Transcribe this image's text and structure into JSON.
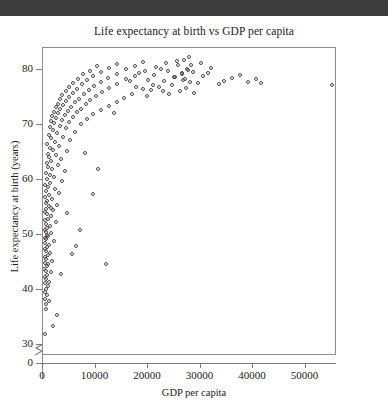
{
  "window": {
    "top_band_color": "#3c3c3c"
  },
  "chart_data": {
    "type": "scatter",
    "title": "Life expectancy at birth vs GDP per capita",
    "xlabel": "GDP per capita",
    "ylabel": "Life expectancy at birth (years)",
    "xlim": [
      0,
      56000
    ],
    "ylim": [
      28,
      84
    ],
    "y_axis_break": true,
    "y_axis_break_note": "axis broken between 0 and ~28",
    "grid": false,
    "legend": null,
    "marker": "open-circle",
    "marker_color": "#4a4a4a",
    "xticks": [
      0,
      10000,
      20000,
      30000,
      40000,
      50000
    ],
    "xtick_labels": [
      "0",
      "10000",
      "20000",
      "30000",
      "40000",
      "50000"
    ],
    "yticks": [
      30,
      40,
      50,
      60,
      70,
      80
    ],
    "ytick_labels": [
      "30",
      "40",
      "50",
      "60",
      "70",
      "80"
    ],
    "y_zero_tick_label": "0",
    "points": [
      [
        420,
        32.0
      ],
      [
        510,
        36.6
      ],
      [
        650,
        37.5
      ],
      [
        300,
        38.3
      ],
      [
        760,
        39.1
      ],
      [
        380,
        39.6
      ],
      [
        560,
        40.2
      ],
      [
        900,
        40.8
      ],
      [
        470,
        41.2
      ],
      [
        1200,
        41.5
      ],
      [
        640,
        42.0
      ],
      [
        350,
        42.4
      ],
      [
        820,
        42.8
      ],
      [
        1500,
        43.2
      ],
      [
        540,
        43.5
      ],
      [
        260,
        43.9
      ],
      [
        700,
        44.3
      ],
      [
        980,
        44.7
      ],
      [
        430,
        45.0
      ],
      [
        1800,
        45.3
      ],
      [
        610,
        45.6
      ],
      [
        330,
        46.0
      ],
      [
        870,
        46.4
      ],
      [
        1350,
        46.8
      ],
      [
        520,
        47.1
      ],
      [
        290,
        47.4
      ],
      [
        740,
        47.8
      ],
      [
        1100,
        48.2
      ],
      [
        450,
        48.5
      ],
      [
        2100,
        48.9
      ],
      [
        580,
        49.2
      ],
      [
        360,
        49.5
      ],
      [
        920,
        49.9
      ],
      [
        1600,
        50.3
      ],
      [
        500,
        50.6
      ],
      [
        310,
        51.0
      ],
      [
        780,
        51.3
      ],
      [
        1250,
        51.7
      ],
      [
        620,
        52.0
      ],
      [
        2400,
        52.3
      ],
      [
        410,
        52.7
      ],
      [
        950,
        53.0
      ],
      [
        1450,
        53.4
      ],
      [
        700,
        53.8
      ],
      [
        340,
        54.1
      ],
      [
        1900,
        54.5
      ],
      [
        560,
        54.8
      ],
      [
        1050,
        55.2
      ],
      [
        2700,
        55.5
      ],
      [
        480,
        55.9
      ],
      [
        800,
        56.2
      ],
      [
        1700,
        56.6
      ],
      [
        390,
        57.0
      ],
      [
        1150,
        57.3
      ],
      [
        3100,
        57.7
      ],
      [
        650,
        58.0
      ],
      [
        2200,
        58.4
      ],
      [
        900,
        58.8
      ],
      [
        460,
        59.1
      ],
      [
        1400,
        59.5
      ],
      [
        3600,
        59.8
      ],
      [
        750,
        60.2
      ],
      [
        2000,
        60.6
      ],
      [
        1250,
        61.0
      ],
      [
        530,
        61.3
      ],
      [
        4100,
        61.6
      ],
      [
        1750,
        62.0
      ],
      [
        980,
        62.4
      ],
      [
        2900,
        62.7
      ],
      [
        680,
        63.1
      ],
      [
        1550,
        63.4
      ],
      [
        3400,
        63.8
      ],
      [
        1150,
        64.1
      ],
      [
        2450,
        64.5
      ],
      [
        860,
        64.8
      ],
      [
        4600,
        65.2
      ],
      [
        1950,
        65.5
      ],
      [
        1350,
        65.9
      ],
      [
        3050,
        66.2
      ],
      [
        760,
        66.6
      ],
      [
        2250,
        66.9
      ],
      [
        5200,
        67.2
      ],
      [
        1550,
        67.6
      ],
      [
        3800,
        67.9
      ],
      [
        1050,
        68.2
      ],
      [
        2700,
        68.5
      ],
      [
        6100,
        68.8
      ],
      [
        1850,
        69.1
      ],
      [
        4300,
        69.4
      ],
      [
        1250,
        69.6
      ],
      [
        3200,
        69.9
      ],
      [
        7200,
        70.1
      ],
      [
        2100,
        70.3
      ],
      [
        5000,
        70.5
      ],
      [
        1500,
        70.7
      ],
      [
        3700,
        70.9
      ],
      [
        8400,
        71.1
      ],
      [
        2400,
        71.3
      ],
      [
        5700,
        71.5
      ],
      [
        1750,
        71.6
      ],
      [
        4200,
        71.8
      ],
      [
        9600,
        72.0
      ],
      [
        2800,
        72.1
      ],
      [
        6400,
        72.3
      ],
      [
        2050,
        72.4
      ],
      [
        4800,
        72.6
      ],
      [
        11000,
        72.7
      ],
      [
        3300,
        72.9
      ],
      [
        7200,
        73.0
      ],
      [
        2400,
        73.2
      ],
      [
        5400,
        73.3
      ],
      [
        12500,
        73.5
      ],
      [
        3800,
        73.6
      ],
      [
        8100,
        73.8
      ],
      [
        2800,
        73.9
      ],
      [
        6100,
        74.1
      ],
      [
        14000,
        74.2
      ],
      [
        4400,
        74.4
      ],
      [
        9000,
        74.5
      ],
      [
        3200,
        74.7
      ],
      [
        6900,
        74.8
      ],
      [
        15500,
        75.0
      ],
      [
        5000,
        75.1
      ],
      [
        10000,
        75.3
      ],
      [
        3700,
        75.4
      ],
      [
        7800,
        75.6
      ],
      [
        17000,
        75.7
      ],
      [
        5700,
        75.9
      ],
      [
        11200,
        76.0
      ],
      [
        4300,
        76.2
      ],
      [
        8700,
        76.3
      ],
      [
        19000,
        76.5
      ],
      [
        6500,
        76.6
      ],
      [
        12500,
        76.8
      ],
      [
        5000,
        76.9
      ],
      [
        9800,
        77.1
      ],
      [
        21000,
        77.2
      ],
      [
        7400,
        77.4
      ],
      [
        14000,
        77.5
      ],
      [
        5800,
        77.7
      ],
      [
        11000,
        77.8
      ],
      [
        23000,
        78.0
      ],
      [
        8400,
        78.1
      ],
      [
        15800,
        78.3
      ],
      [
        6700,
        78.4
      ],
      [
        12400,
        78.6
      ],
      [
        25000,
        78.7
      ],
      [
        9600,
        78.9
      ],
      [
        17500,
        79.0
      ],
      [
        7700,
        79.2
      ],
      [
        14000,
        79.3
      ],
      [
        26500,
        79.5
      ],
      [
        11000,
        79.6
      ],
      [
        19500,
        79.8
      ],
      [
        8900,
        79.9
      ],
      [
        15800,
        80.1
      ],
      [
        27500,
        80.2
      ],
      [
        12500,
        80.4
      ],
      [
        21500,
        80.5
      ],
      [
        10200,
        80.7
      ],
      [
        17500,
        80.8
      ],
      [
        28200,
        81.0
      ],
      [
        14000,
        81.1
      ],
      [
        23500,
        81.3
      ],
      [
        19000,
        81.4
      ],
      [
        25500,
        81.6
      ],
      [
        26800,
        81.9
      ],
      [
        27900,
        82.4
      ],
      [
        22000,
        77.0
      ],
      [
        24500,
        77.3
      ],
      [
        29500,
        77.6
      ],
      [
        30500,
        78.9
      ],
      [
        31500,
        79.4
      ],
      [
        26000,
        76.2
      ],
      [
        27200,
        76.7
      ],
      [
        28800,
        75.9
      ],
      [
        24000,
        75.6
      ],
      [
        25800,
        80.9
      ],
      [
        26400,
        79.2
      ],
      [
        27000,
        78.4
      ],
      [
        27600,
        80.0
      ],
      [
        28000,
        77.8
      ],
      [
        28500,
        79.7
      ],
      [
        26700,
        78.1
      ],
      [
        25200,
        78.8
      ],
      [
        23800,
        79.9
      ],
      [
        22500,
        80.2
      ],
      [
        21200,
        79.1
      ],
      [
        20000,
        78.2
      ],
      [
        18200,
        79.4
      ],
      [
        16500,
        78.0
      ],
      [
        20500,
        76.4
      ],
      [
        22800,
        76.1
      ],
      [
        19800,
        75.3
      ],
      [
        17800,
        77.0
      ],
      [
        33500,
        77.5
      ],
      [
        34500,
        78.0
      ],
      [
        36000,
        78.6
      ],
      [
        37500,
        79.1
      ],
      [
        39000,
        77.9
      ],
      [
        40500,
        78.3
      ],
      [
        41500,
        77.6
      ],
      [
        55000,
        77.3
      ],
      [
        30000,
        81.2
      ],
      [
        32000,
        80.4
      ],
      [
        8000,
        65.0
      ],
      [
        9500,
        57.5
      ],
      [
        7000,
        51.0
      ],
      [
        12000,
        44.8
      ],
      [
        5500,
        46.5
      ],
      [
        10500,
        62.0
      ],
      [
        4500,
        54.0
      ],
      [
        6200,
        48.0
      ],
      [
        3500,
        43.0
      ],
      [
        13500,
        72.2
      ],
      [
        2600,
        35.5
      ],
      [
        1900,
        33.5
      ],
      [
        1100,
        38.0
      ],
      [
        820,
        50.0
      ],
      [
        1450,
        55.0
      ]
    ]
  }
}
